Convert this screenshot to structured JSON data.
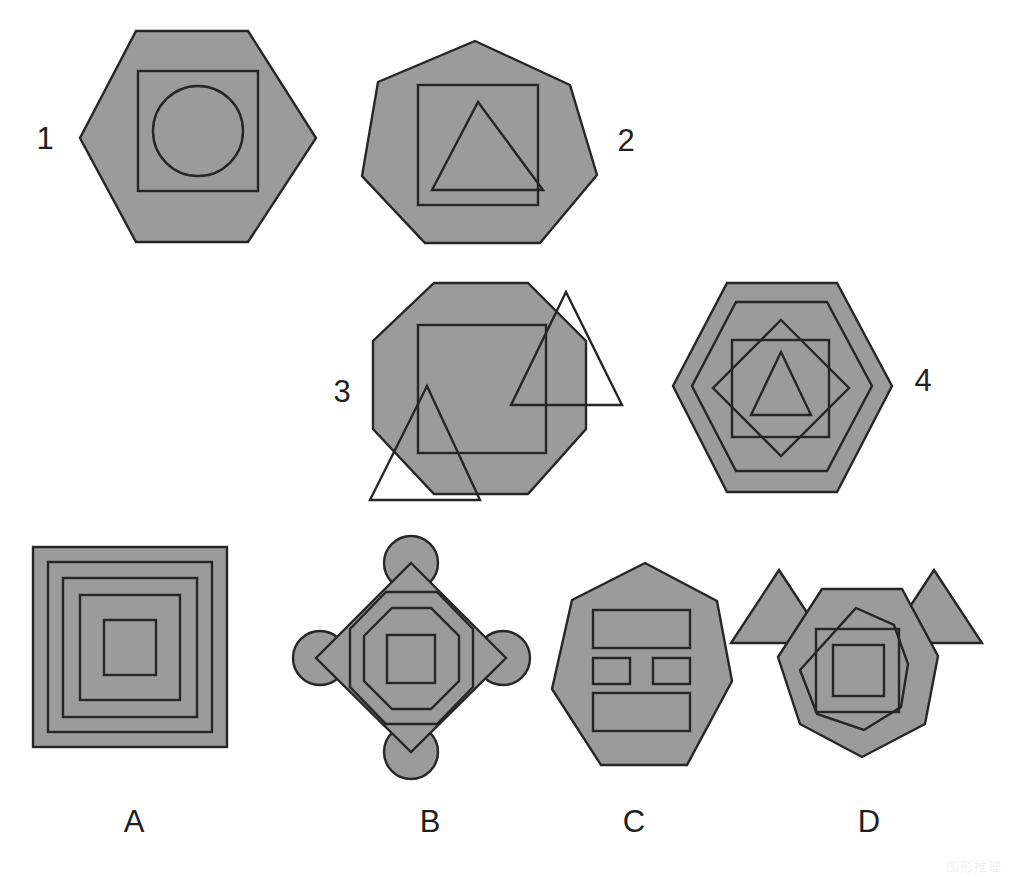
{
  "page": {
    "kind": "abstract-reasoning-figure-puzzle",
    "width": 1010,
    "height": 877,
    "background_color": "#ffffff",
    "shape_fill_color": "#9b9b9b",
    "shape_stroke_color": "#262626"
  },
  "watermark": {
    "text": "图形推理"
  },
  "questions": {
    "labels": [
      "1",
      "2",
      "3",
      "4"
    ],
    "items": [
      {
        "label": "1",
        "label_position": {
          "x": 45,
          "y": 141
        },
        "description": "Hexagon containing a square containing a circle",
        "outer_shape": "hexagon",
        "inner_shapes": [
          "square",
          "circle"
        ],
        "shape_count": 3
      },
      {
        "label": "2",
        "label_position": {
          "x": 626,
          "y": 143
        },
        "description": "Heptagon containing a square containing a triangle",
        "outer_shape": "heptagon",
        "inner_shapes": [
          "square",
          "triangle"
        ],
        "shape_count": 3
      },
      {
        "label": "3",
        "label_position": {
          "x": 342,
          "y": 394
        },
        "description": "Octagon containing a square with two triangles overlapping its edges",
        "outer_shape": "octagon",
        "inner_shapes": [
          "square",
          "triangle",
          "triangle"
        ],
        "shape_count": 4
      },
      {
        "label": "4",
        "label_position": {
          "x": 923,
          "y": 383
        },
        "description": "Hexagon containing a hexagon, a square, a diamond and a triangle",
        "outer_shape": "hexagon",
        "inner_shapes": [
          "hexagon",
          "square",
          "diamond",
          "triangle"
        ],
        "shape_count": 5
      }
    ]
  },
  "options": {
    "labels": [
      "A",
      "B",
      "C",
      "D"
    ],
    "items": [
      {
        "label": "A",
        "label_position": {
          "x": 134,
          "y": 824
        },
        "description": "Five concentric squares",
        "outer_shape": "square",
        "inner_shapes": [
          "square",
          "square",
          "square",
          "square"
        ],
        "shape_count": 5
      },
      {
        "label": "B",
        "label_position": {
          "x": 430,
          "y": 824
        },
        "description": "Diamond with four corner circles, two nested octagons and a centre square",
        "outer_shape": "diamond",
        "inner_shapes": [
          "circle",
          "circle",
          "circle",
          "circle",
          "octagon",
          "octagon",
          "square"
        ],
        "shape_count": 8
      },
      {
        "label": "C",
        "label_position": {
          "x": 634,
          "y": 824
        },
        "description": "Heptagon containing four rectangles",
        "outer_shape": "heptagon",
        "inner_shapes": [
          "rectangle",
          "rectangle",
          "rectangle",
          "rectangle"
        ],
        "shape_count": 5
      },
      {
        "label": "D",
        "label_position": {
          "x": 869,
          "y": 824
        },
        "description": "Heptagon with two outward triangles, an inner heptagon and two nested squares",
        "outer_shape": "heptagon",
        "inner_shapes": [
          "triangle",
          "triangle",
          "heptagon",
          "square",
          "square"
        ],
        "shape_count": 6
      }
    ]
  }
}
